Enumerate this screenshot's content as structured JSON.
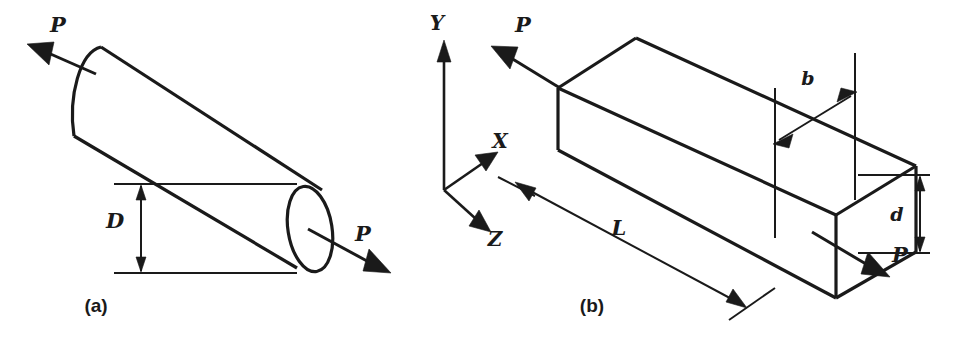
{
  "figure": {
    "canvas": {
      "width": 955,
      "height": 344,
      "background": "#ffffff",
      "ink": "#1a1a1a"
    },
    "panels": [
      {
        "id": "panel-a",
        "caption": "(a)",
        "caption_pos": {
          "x": 96,
          "y": 312
        },
        "shape": "circular-cylinder-bar-in-tension",
        "labels": {
          "force_left": "P",
          "force_right": "P",
          "diameter": "D"
        },
        "label_positions": {
          "force_left": {
            "x": 58,
            "y": 32
          },
          "force_right": {
            "x": 363,
            "y": 241
          },
          "diameter": {
            "x": 115,
            "y": 228
          }
        }
      },
      {
        "id": "panel-b",
        "caption": "(b)",
        "caption_pos": {
          "x": 592,
          "y": 312
        },
        "shape": "rectangular-prism-bar-in-tension",
        "labels": {
          "force_left": "P",
          "force_right": "P",
          "width": "b",
          "depth": "d",
          "length": "L",
          "axis_y": "Y",
          "axis_x": "X",
          "axis_z": "Z"
        },
        "label_positions": {
          "force_left": {
            "x": 523,
            "y": 32
          },
          "force_right": {
            "x": 894,
            "y": 258
          },
          "width": {
            "x": 808,
            "y": 85
          },
          "depth": {
            "x": 897,
            "y": 221
          },
          "length": {
            "x": 619,
            "y": 235
          },
          "axis_y": {
            "x": 437,
            "y": 30
          },
          "axis_x": {
            "x": 498,
            "y": 155
          },
          "axis_z": {
            "x": 492,
            "y": 242
          }
        }
      }
    ]
  },
  "geometry": {
    "cylinder": {
      "axis_angle_deg": 31,
      "end_ellipse": {
        "cx": 310,
        "cy": 228,
        "rx": 22,
        "ry": 43,
        "rotate": -8
      },
      "dim_top_y": 183,
      "dim_bottom_y": 274,
      "dim_x": 131
    },
    "box": {
      "front_top_left": {
        "x": 558,
        "y": 88
      },
      "front_bottom_left": {
        "x": 558,
        "y": 150
      },
      "back_top_left": {
        "x": 636,
        "y": 38
      },
      "front_top_right": {
        "x": 836,
        "y": 215
      },
      "front_bottom_right": {
        "x": 836,
        "y": 298
      },
      "right_top_corner": {
        "x": 853,
        "y": 178
      },
      "right_bottom_corner": {
        "x": 853,
        "y": 252
      },
      "back_top_right": {
        "x": 916,
        "y": 166
      }
    },
    "axes_origin": {
      "x": 444,
      "y": 190
    }
  }
}
